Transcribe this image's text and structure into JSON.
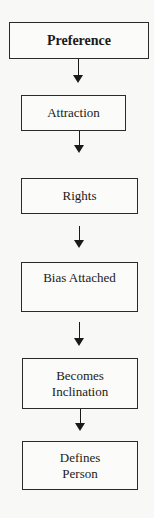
{
  "diagram": {
    "type": "vertical-flowchart",
    "nodes": [
      {
        "id": "preference",
        "label": "Preference"
      },
      {
        "id": "attraction",
        "label": "Attraction"
      },
      {
        "id": "rights",
        "label": "Rights"
      },
      {
        "id": "bias-attached",
        "label": "Bias Attached"
      },
      {
        "id": "becomes-inclination",
        "line1": "Becomes",
        "line2": "Inclination"
      },
      {
        "id": "defines-person",
        "line1": "Defines",
        "line2": "Person"
      }
    ],
    "edges": [
      {
        "from": "preference",
        "to": "attraction"
      },
      {
        "from": "attraction",
        "to": "rights"
      },
      {
        "from": "rights",
        "to": "bias-attached"
      },
      {
        "from": "bias-attached",
        "to": "becomes-inclination"
      },
      {
        "from": "becomes-inclination",
        "to": "defines-person"
      }
    ]
  }
}
